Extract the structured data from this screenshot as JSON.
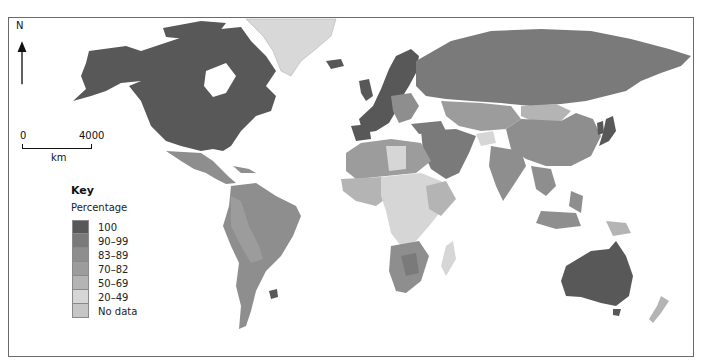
{
  "map": {
    "type": "choropleth",
    "subject": "World map by percentage",
    "north_arrow": {
      "label": "N"
    },
    "scale_bar": {
      "start": "0",
      "end": "4000",
      "unit": "km"
    },
    "key": {
      "title": "Key",
      "subtitle": "Percentage",
      "items": [
        {
          "label": "100",
          "color": "#585858"
        },
        {
          "label": "90–99",
          "color": "#7a7a7a"
        },
        {
          "label": "83–89",
          "color": "#8e8e8e"
        },
        {
          "label": "70–82",
          "color": "#9c9c9c"
        },
        {
          "label": "50–69",
          "color": "#b4b4b4"
        },
        {
          "label": "20–49",
          "color": "#d6d6d6"
        },
        {
          "label": "No data",
          "color": "#c6c6c6"
        }
      ]
    },
    "regions": [
      {
        "name": "North America (Canada, USA)",
        "class": "100"
      },
      {
        "name": "Greenland",
        "class": "No data"
      },
      {
        "name": "Mexico / Central America",
        "class": "83–89"
      },
      {
        "name": "South America",
        "class": "83–89"
      },
      {
        "name": "Uruguay",
        "class": "100"
      },
      {
        "name": "Western Europe / Scandinavia",
        "class": "100"
      },
      {
        "name": "Russia",
        "class": "90–99"
      },
      {
        "name": "Central Asia",
        "class": "70–82"
      },
      {
        "name": "Mongolia",
        "class": "50–69"
      },
      {
        "name": "China",
        "class": "83–89"
      },
      {
        "name": "Japan / Korea",
        "class": "100"
      },
      {
        "name": "Middle East",
        "class": "90–99"
      },
      {
        "name": "Afghanistan",
        "class": "20–49"
      },
      {
        "name": "India",
        "class": "83–89"
      },
      {
        "name": "Southeast Asia",
        "class": "83–89"
      },
      {
        "name": "North Africa",
        "class": "70–82"
      },
      {
        "name": "Sub-Saharan Africa",
        "class": "20–49"
      },
      {
        "name": "Southern Africa",
        "class": "83–89"
      },
      {
        "name": "Australia",
        "class": "100"
      },
      {
        "name": "New Zealand",
        "class": "50–69"
      }
    ]
  }
}
